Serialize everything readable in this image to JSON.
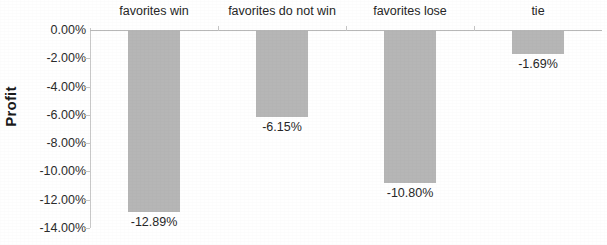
{
  "chart_data": {
    "type": "bar",
    "title": "",
    "xlabel": "",
    "ylabel": "Profit",
    "categories": [
      "favorites win",
      "favorites do not win",
      "favorites lose",
      "tie"
    ],
    "values": [
      -12.89,
      -6.15,
      -10.8,
      -1.69
    ],
    "value_labels": [
      "-12.89%",
      "-6.15%",
      "-10.80%",
      "-1.69%"
    ],
    "ylim": [
      -14.0,
      0.0
    ],
    "ytick_labels": [
      "0.00%",
      "-2.00%",
      "-4.00%",
      "-6.00%",
      "-8.00%",
      "-10.00%",
      "-12.00%",
      "-14.00%"
    ],
    "ytick_values": [
      0,
      -2,
      -4,
      -6,
      -8,
      -10,
      -12,
      -14
    ],
    "grid": false,
    "legend": "none",
    "category_label_position": "top",
    "value_label_position": "below-bar",
    "bar_color": "#b6b6b6",
    "axis_color": "#c0c0c0",
    "text_color": "#262626",
    "background_color": "#ffffff"
  }
}
